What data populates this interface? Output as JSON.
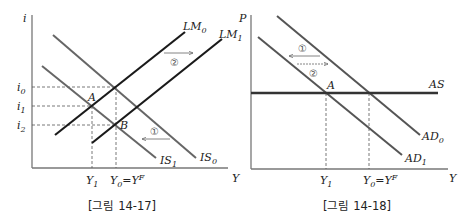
{
  "figures": [
    {
      "caption": "[그림 14-17]",
      "y_axis_label": "i",
      "x_axis_label": "Y",
      "curves": {
        "LM0": {
          "name": "LM",
          "sub": "0"
        },
        "LM1": {
          "name": "LM",
          "sub": "1"
        },
        "IS0": {
          "name": "IS",
          "sub": "0"
        },
        "IS1": {
          "name": "IS",
          "sub": "1"
        }
      },
      "y_ticks": [
        {
          "name": "i",
          "sub": "0"
        },
        {
          "name": "i",
          "sub": "1"
        },
        {
          "name": "i",
          "sub": "2"
        }
      ],
      "x_ticks": [
        {
          "label": "Y",
          "sub": "1"
        },
        {
          "label": "Y",
          "sub": "0",
          "eq": "=Y",
          "sup": "F"
        }
      ],
      "points": [
        "A",
        "B"
      ],
      "annotations": [
        {
          "symbol": "①",
          "direction": "left",
          "note": "IS shifts left"
        },
        {
          "symbol": "②",
          "direction": "right",
          "note": "LM shifts right"
        }
      ]
    },
    {
      "caption": "[그림 14-18]",
      "y_axis_label": "P",
      "x_axis_label": "Y",
      "curves": {
        "AS": {
          "name": "AS"
        },
        "AD0": {
          "name": "AD",
          "sub": "0"
        },
        "AD1": {
          "name": "AD",
          "sub": "1"
        }
      },
      "x_ticks": [
        {
          "label": "Y",
          "sub": "1"
        },
        {
          "label": "Y",
          "sub": "0",
          "eq": "=Y",
          "sup": "F"
        }
      ],
      "points": [
        "A"
      ],
      "annotations": [
        {
          "symbol": "①",
          "direction": "left"
        },
        {
          "symbol": "②",
          "direction": "right"
        }
      ]
    }
  ],
  "colors": {
    "axis": "#777777",
    "lm_line": "#1a1a1a",
    "is_line": "#666666",
    "as_line": "#333333",
    "guide": "#555555"
  }
}
